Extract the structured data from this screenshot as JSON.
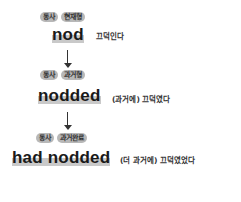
{
  "rows": [
    {
      "badges": [
        "동사",
        "현재형"
      ],
      "word": "nod",
      "meaning": "끄덕인다"
    },
    {
      "badges": [
        "동사",
        "과거형"
      ],
      "word": "nodded",
      "meaning": "(과거에) 끄덕였다"
    },
    {
      "badges": [
        "동사",
        "과거완료"
      ],
      "word": "had nodded",
      "meaning": "(더 과거에) 끄덕였었다"
    }
  ],
  "arrows": [
    "down-arrow",
    "down-arrow"
  ],
  "colors": {
    "badge_bg": "#b8b8b8",
    "highlight": "#c9c9c9",
    "text": "#1a1a1a"
  }
}
